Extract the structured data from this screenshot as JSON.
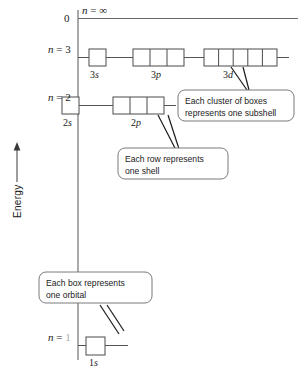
{
  "diagram": {
    "axis": {
      "energy_label": "Energy",
      "zero_label": "0",
      "arrow_direction": "up"
    },
    "levels": [
      {
        "id": "n-infinity",
        "n_prefix": "n",
        "n_equals": "=",
        "n_value": "∞",
        "subshells": []
      },
      {
        "id": "n-3",
        "n_prefix": "n",
        "n_equals": "=",
        "n_value": "3",
        "subshells": [
          {
            "label_n": "3",
            "label_l": "s",
            "boxes": 1
          },
          {
            "label_n": "3",
            "label_l": "p",
            "boxes": 3
          },
          {
            "label_n": "3",
            "label_l": "d",
            "boxes": 5
          }
        ]
      },
      {
        "id": "n-2",
        "n_prefix": "n",
        "n_equals": "=",
        "n_value": "2",
        "subshells": [
          {
            "label_n": "2",
            "label_l": "s",
            "boxes": 1
          },
          {
            "label_n": "2",
            "label_l": "p",
            "boxes": 3
          }
        ]
      },
      {
        "id": "n-1",
        "n_prefix": "n",
        "n_equals": "=",
        "n_value": "1",
        "subshells": [
          {
            "label_n": "1",
            "label_l": "s",
            "boxes": 1
          }
        ]
      }
    ],
    "callouts": [
      {
        "id": "subshell-callout",
        "text": "Each cluster of boxes\nrepresents one subshell"
      },
      {
        "id": "shell-callout",
        "text": "Each row represents\none shell"
      },
      {
        "id": "orbital-callout",
        "text": "Each box represents\none orbital"
      }
    ],
    "colors": {
      "ink": "#1a1a1a",
      "line": "#555555",
      "box_stroke": "#4a4a4a",
      "callout_stroke": "#7a7a7a",
      "background": "#ffffff"
    }
  }
}
